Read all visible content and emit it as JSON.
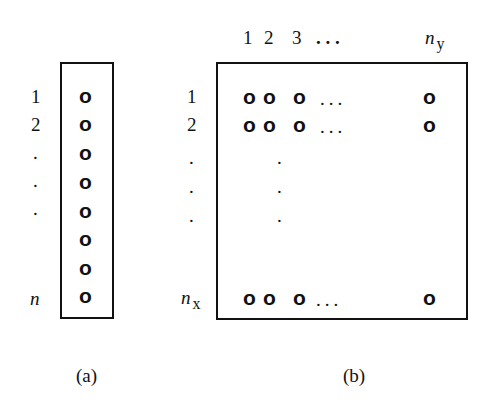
{
  "panel_a": {
    "caption": "(a)",
    "row_labels": [
      "1",
      "2",
      ".",
      ".",
      ".",
      "",
      "",
      "n"
    ],
    "cells": [
      "o",
      "o",
      "o",
      "o",
      "o",
      "o",
      "o",
      "o"
    ]
  },
  "panel_b": {
    "caption": "(b)",
    "col_labels": {
      "c1": "1",
      "c2": "2",
      "c3": "3",
      "ellipsis": ". . .",
      "last": "n",
      "last_sub": "y"
    },
    "row_labels": {
      "r1": "1",
      "r2": "2",
      "d1": ".",
      "d2": ".",
      "d3": ".",
      "last": "n",
      "last_sub": "x"
    },
    "cell": "o",
    "row_ellipsis": "...",
    "vert_dot": "."
  }
}
